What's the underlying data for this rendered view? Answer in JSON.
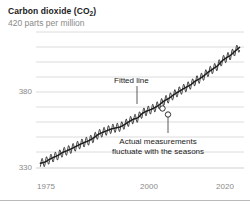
{
  "header": {
    "title_main": "Carbon dioxide (CO",
    "title_sub": "2",
    "title_close": ")",
    "title_full": "Carbon dioxide (CO2)",
    "subtitle": "420 parts per million"
  },
  "annotations": {
    "fitted_line": "Fitted line",
    "actual_line1": "Actual measurements",
    "actual_line2": "fluctuate with the seasons"
  },
  "axis": {
    "y_ticks": [
      "380",
      "330"
    ],
    "x_ticks": [
      "1975",
      "2000",
      "2020"
    ]
  },
  "colors": {
    "ink": "#1a1a1a",
    "muted": "#8a8a8a",
    "grid": "#dcdcdc",
    "rule": "#b9b9b9",
    "series": "#232323",
    "background": "#ffffff"
  },
  "chart_data": {
    "type": "line",
    "title": "Carbon dioxide (CO2)",
    "subtitle": "420 parts per million",
    "xlabel": "",
    "ylabel": "parts per million",
    "xlim": [
      1974,
      2021
    ],
    "ylim": [
      322,
      425
    ],
    "y_tick_values": [
      330,
      380
    ],
    "x_tick_values": [
      1975,
      2000,
      2020
    ],
    "grid": "horizontal",
    "legend": "none",
    "annotations": [
      {
        "text": "Fitted line",
        "points_to_x": 1998.5,
        "points_to_y": 367
      },
      {
        "text": "Actual measurements fluctuate with the seasons",
        "points_to_x": 2000.5,
        "points_to_y": 363
      }
    ],
    "markers": [
      {
        "label": "Fitted line",
        "x": 1998.5,
        "y": 367
      },
      {
        "label": "Actual measurements",
        "x": 2000.5,
        "y": 363
      }
    ],
    "series": [
      {
        "name": "Fitted line (trend)",
        "style": "smooth",
        "x": [
          1975,
          1976,
          1977,
          1978,
          1979,
          1980,
          1981,
          1982,
          1983,
          1984,
          1985,
          1986,
          1987,
          1988,
          1989,
          1990,
          1991,
          1992,
          1993,
          1994,
          1995,
          1996,
          1997,
          1998,
          1999,
          2000,
          2001,
          2002,
          2003,
          2004,
          2005,
          2006,
          2007,
          2008,
          2009,
          2010,
          2011,
          2012,
          2013,
          2014,
          2015,
          2016,
          2017,
          2018,
          2019,
          2020
        ],
        "values": [
          331.1,
          332.0,
          333.8,
          335.4,
          336.8,
          338.8,
          340.1,
          341.5,
          343.1,
          344.7,
          346.1,
          347.4,
          349.2,
          351.6,
          353.1,
          354.4,
          355.6,
          356.4,
          357.1,
          358.8,
          360.8,
          362.6,
          363.7,
          366.7,
          368.4,
          369.6,
          371.2,
          373.3,
          375.8,
          377.5,
          379.8,
          381.9,
          383.8,
          385.6,
          387.4,
          389.9,
          391.6,
          393.9,
          396.5,
          398.6,
          400.8,
          404.2,
          406.5,
          408.5,
          411.4,
          414.0
        ]
      },
      {
        "name": "Actual measurements (monthly, seasonal)",
        "style": "sawtooth",
        "seasonal_amplitude_ppm": 3.2,
        "note": "monthly oscillation superimposed on trend, peak in May, trough in September"
      }
    ]
  }
}
